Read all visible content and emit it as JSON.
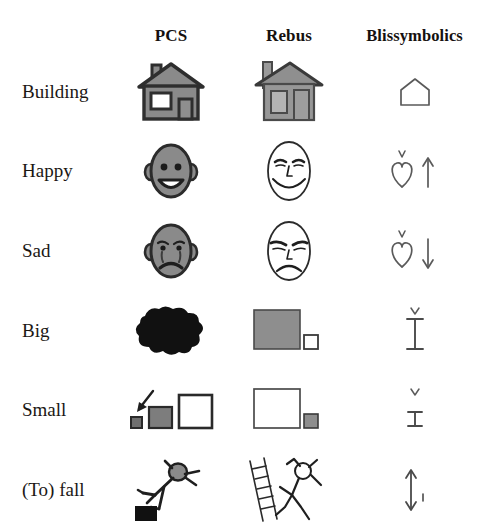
{
  "figure": {
    "kind": "symbol-comparison-table",
    "background": "#ffffff",
    "ink": "#1b1714",
    "gray_fill": "#8a8a8a",
    "dark_outline": "#3a3a3a",
    "black_fill": "#111111"
  },
  "columns": [
    {
      "key": "label",
      "label": ""
    },
    {
      "key": "pcs",
      "label": "PCS"
    },
    {
      "key": "rebus",
      "label": "Rebus"
    },
    {
      "key": "bliss",
      "label": "Blissymbolics"
    }
  ],
  "rows": [
    {
      "label": "Building",
      "pcs": {
        "icon": "pcs-house-icon",
        "description": "gray house with chimney, square window and door"
      },
      "rebus": {
        "icon": "rebus-house-icon",
        "description": "gray hatched house with tall left chimney, window and door"
      },
      "bliss": {
        "icon": "bliss-house-icon",
        "description": "simple house outline, pentagon"
      }
    },
    {
      "label": "Happy",
      "pcs": {
        "icon": "pcs-happy-face-icon",
        "description": "gray oval face with ears, dot eyes and wide open smile"
      },
      "rebus": {
        "icon": "rebus-happy-face-icon",
        "description": "line drawn oval face with eyebrows, eyes, nose and broad smile"
      },
      "bliss": {
        "icon": "bliss-happy-icon",
        "description": "heart with caret above, followed by up arrow"
      }
    },
    {
      "label": "Sad",
      "pcs": {
        "icon": "pcs-sad-face-icon",
        "description": "gray oval face with ears, downturned mouth and tears"
      },
      "rebus": {
        "icon": "rebus-sad-face-icon",
        "description": "line drawn oval face with sloping brows and frown"
      },
      "bliss": {
        "icon": "bliss-sad-icon",
        "description": "heart with caret above, followed by down arrow"
      }
    },
    {
      "label": "Big",
      "pcs": {
        "icon": "pcs-big-blob-icon",
        "description": "large solid black irregular blob"
      },
      "rebus": {
        "icon": "rebus-big-squares-icon",
        "description": "large gray square beside a small white square"
      },
      "bliss": {
        "icon": "bliss-big-icon",
        "description": "tall I-beam measure with caret above"
      }
    },
    {
      "label": "Small",
      "pcs": {
        "icon": "pcs-small-squares-icon",
        "description": "arrow pointing to tiny dark square, medium gray square, large white square"
      },
      "rebus": {
        "icon": "rebus-small-squares-icon",
        "description": "large white square beside a small gray square"
      },
      "bliss": {
        "icon": "bliss-small-icon",
        "description": "short I-beam measure with caret above"
      }
    },
    {
      "label": "(To) fall",
      "pcs": {
        "icon": "pcs-falling-figure-icon",
        "description": "stick figure falling backwards off a black block"
      },
      "rebus": {
        "icon": "rebus-falling-figure-icon",
        "description": "stick figure falling from a ladder"
      },
      "bliss": {
        "icon": "bliss-fall-icon",
        "description": "double headed vertical arrow with small mark"
      }
    }
  ]
}
